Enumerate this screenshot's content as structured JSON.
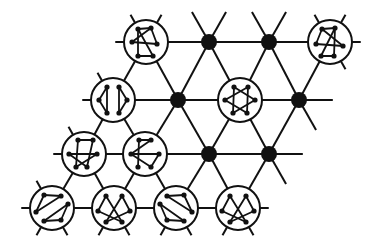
{
  "diagram": {
    "title": "",
    "colors": {
      "line": "#111111",
      "background": "#ffffff",
      "dot": "#111111"
    },
    "lattice": {
      "dx": 61.5,
      "dy": 54.5,
      "shear": -31,
      "origin": [
        146,
        42
      ]
    },
    "nodes": [
      {
        "id": "r0c0",
        "row": 0,
        "col": 0,
        "x": 146,
        "y": 42,
        "type": "graph",
        "graph": "triangle-cross"
      },
      {
        "id": "r0c1",
        "row": 0,
        "col": 1,
        "x": 209,
        "y": 42,
        "type": "dot"
      },
      {
        "id": "r0c2",
        "row": 0,
        "col": 2,
        "x": 269,
        "y": 42,
        "type": "dot"
      },
      {
        "id": "r0c3",
        "row": 0,
        "col": 3,
        "x": 330,
        "y": 42,
        "type": "graph",
        "graph": "triangle-cross-mirror"
      },
      {
        "id": "r1c0",
        "row": 1,
        "col": 0,
        "x": 113,
        "y": 100,
        "type": "graph",
        "graph": "two-triangles-vertical"
      },
      {
        "id": "r1c1",
        "row": 1,
        "col": 1,
        "x": 178,
        "y": 100,
        "type": "dot"
      },
      {
        "id": "r1c2",
        "row": 1,
        "col": 2,
        "x": 240,
        "y": 100,
        "type": "graph",
        "graph": "hexagram"
      },
      {
        "id": "r1c3",
        "row": 1,
        "col": 3,
        "x": 299,
        "y": 100,
        "type": "dot"
      },
      {
        "id": "r2c0",
        "row": 2,
        "col": 0,
        "x": 84,
        "y": 154,
        "type": "graph",
        "graph": "twisted-hexagon-a"
      },
      {
        "id": "r2c1",
        "row": 2,
        "col": 1,
        "x": 145,
        "y": 154,
        "type": "graph",
        "graph": "twisted-hexagon-b"
      },
      {
        "id": "r2c2",
        "row": 2,
        "col": 2,
        "x": 209,
        "y": 154,
        "type": "dot"
      },
      {
        "id": "r2c3",
        "row": 2,
        "col": 3,
        "x": 269,
        "y": 154,
        "type": "dot"
      },
      {
        "id": "r3c0",
        "row": 3,
        "col": 0,
        "x": 52,
        "y": 208,
        "type": "graph",
        "graph": "two-triangles-diagonal"
      },
      {
        "id": "r3c1",
        "row": 3,
        "col": 1,
        "x": 114,
        "y": 208,
        "type": "graph",
        "graph": "crossed-bells"
      },
      {
        "id": "r3c2",
        "row": 3,
        "col": 2,
        "x": 176,
        "y": 208,
        "type": "graph",
        "graph": "two-triangles-diagonal-mirror"
      },
      {
        "id": "r3c3",
        "row": 3,
        "col": 3,
        "x": 238,
        "y": 208,
        "type": "graph",
        "graph": "crossed-bells"
      }
    ],
    "graphs": {
      "triangle-cross": {
        "verts": [
          [
            -8,
            -13
          ],
          [
            5,
            -14
          ],
          [
            11,
            2
          ],
          [
            -14,
            0
          ],
          [
            -8,
            14
          ],
          [
            7,
            14
          ]
        ],
        "edges": [
          [
            0,
            1
          ],
          [
            1,
            3
          ],
          [
            0,
            4
          ],
          [
            4,
            5
          ],
          [
            5,
            0
          ],
          [
            1,
            2
          ],
          [
            3,
            2
          ]
        ]
      },
      "triangle-cross-mirror": {
        "verts": [
          [
            -8,
            -13
          ],
          [
            5,
            -14
          ],
          [
            13,
            4
          ],
          [
            -14,
            2
          ],
          [
            -9,
            14
          ],
          [
            4,
            14
          ]
        ],
        "edges": [
          [
            0,
            1
          ],
          [
            0,
            3
          ],
          [
            1,
            4
          ],
          [
            4,
            5
          ],
          [
            5,
            1
          ],
          [
            0,
            2
          ],
          [
            3,
            2
          ]
        ]
      },
      "two-triangles-vertical": {
        "verts": [
          [
            -6,
            -13
          ],
          [
            -14,
            0
          ],
          [
            -6,
            13
          ],
          [
            6,
            -13
          ],
          [
            14,
            0
          ],
          [
            6,
            13
          ]
        ],
        "edges": [
          [
            0,
            1
          ],
          [
            1,
            2
          ],
          [
            2,
            0
          ],
          [
            3,
            4
          ],
          [
            4,
            5
          ],
          [
            5,
            3
          ]
        ]
      },
      "hexagram": {
        "verts": [
          [
            -6,
            -13
          ],
          [
            8,
            -13
          ],
          [
            15,
            0
          ],
          [
            7,
            13
          ],
          [
            -7,
            13
          ],
          [
            -15,
            0
          ]
        ],
        "edges": [
          [
            0,
            2
          ],
          [
            2,
            4
          ],
          [
            4,
            0
          ],
          [
            1,
            3
          ],
          [
            3,
            5
          ],
          [
            5,
            1
          ]
        ]
      },
      "twisted-hexagon-a": {
        "verts": [
          [
            -6,
            -14
          ],
          [
            9,
            -14
          ],
          [
            13,
            0
          ],
          [
            3,
            13
          ],
          [
            -8,
            13
          ],
          [
            -15,
            0
          ]
        ],
        "edges": [
          [
            0,
            1
          ],
          [
            1,
            3
          ],
          [
            0,
            4
          ],
          [
            5,
            2
          ],
          [
            2,
            4
          ],
          [
            5,
            3
          ]
        ]
      },
      "twisted-hexagon-b": {
        "verts": [
          [
            -6,
            -14
          ],
          [
            6,
            -14
          ],
          [
            14,
            0
          ],
          [
            6,
            13
          ],
          [
            -7,
            13
          ],
          [
            -14,
            0
          ]
        ],
        "edges": [
          [
            0,
            1
          ],
          [
            1,
            5
          ],
          [
            0,
            4
          ],
          [
            5,
            2
          ],
          [
            2,
            3
          ],
          [
            5,
            3
          ]
        ]
      },
      "two-triangles-diagonal": {
        "verts": [
          [
            -8,
            -13
          ],
          [
            9,
            -12
          ],
          [
            -16,
            4
          ],
          [
            16,
            -4
          ],
          [
            -8,
            13
          ],
          [
            9,
            12
          ]
        ],
        "edges": [
          [
            0,
            1
          ],
          [
            1,
            2
          ],
          [
            2,
            0
          ],
          [
            3,
            4
          ],
          [
            4,
            5
          ],
          [
            5,
            3
          ]
        ]
      },
      "two-triangles-diagonal-mirror": {
        "verts": [
          [
            -9,
            -12
          ],
          [
            8,
            -13
          ],
          [
            16,
            4
          ],
          [
            -16,
            -4
          ],
          [
            -9,
            12
          ],
          [
            8,
            13
          ]
        ],
        "edges": [
          [
            0,
            1
          ],
          [
            1,
            2
          ],
          [
            2,
            0
          ],
          [
            3,
            4
          ],
          [
            4,
            5
          ],
          [
            5,
            3
          ]
        ]
      },
      "crossed-bells": {
        "verts": [
          [
            -8,
            -12
          ],
          [
            8,
            -12
          ],
          [
            -16,
            3
          ],
          [
            16,
            3
          ],
          [
            -8,
            14
          ],
          [
            8,
            14
          ]
        ],
        "edges": [
          [
            0,
            2
          ],
          [
            0,
            5
          ],
          [
            2,
            5
          ],
          [
            1,
            3
          ],
          [
            1,
            4
          ],
          [
            3,
            4
          ]
        ]
      }
    }
  }
}
